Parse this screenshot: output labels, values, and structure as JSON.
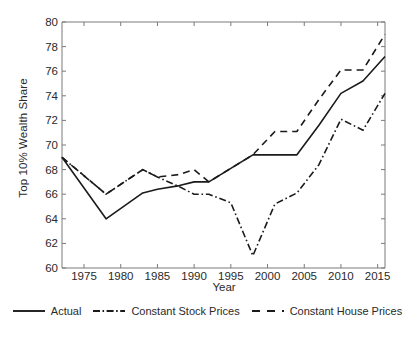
{
  "chart_data": {
    "type": "line",
    "title": "",
    "xlabel": "Year",
    "ylabel": "Top 10% Wealth Share",
    "xlim": [
      1972,
      2016
    ],
    "ylim": [
      60,
      80
    ],
    "xticks": [
      1975,
      1980,
      1985,
      1990,
      1995,
      2000,
      2005,
      2010,
      2015
    ],
    "yticks": [
      60,
      62,
      64,
      66,
      68,
      70,
      72,
      74,
      76,
      78,
      80
    ],
    "grid": false,
    "legend_position": "bottom",
    "series": [
      {
        "name": "Actual",
        "style": "solid",
        "color": "#1b1b1b",
        "x": [
          1972,
          1978,
          1983,
          1985,
          1988,
          1990,
          1992,
          1995,
          1998,
          2001,
          2004,
          2007,
          2010,
          2013,
          2016
        ],
        "values": [
          69.0,
          64.0,
          66.1,
          66.4,
          66.7,
          67.0,
          67.0,
          68.1,
          69.2,
          69.2,
          69.2,
          71.6,
          74.2,
          75.2,
          77.2
        ]
      },
      {
        "name": "Constant Stock Prices",
        "style": "dashdot",
        "color": "#1b1b1b",
        "x": [
          1972,
          1978,
          1983,
          1985,
          1988,
          1990,
          1992,
          1995,
          1998,
          2001,
          2004,
          2007,
          2010,
          2013,
          2016
        ],
        "values": [
          69.0,
          66.0,
          68.0,
          67.4,
          66.6,
          66.0,
          66.0,
          65.3,
          61.0,
          65.2,
          66.1,
          68.4,
          72.1,
          71.2,
          74.2
        ]
      },
      {
        "name": "Constant House Prices",
        "style": "dashed",
        "color": "#1b1b1b",
        "x": [
          1972,
          1978,
          1983,
          1985,
          1988,
          1990,
          1992,
          1995,
          1998,
          2001,
          2004,
          2007,
          2010,
          2013,
          2016
        ],
        "values": [
          69.0,
          66.0,
          68.0,
          67.4,
          67.6,
          68.0,
          67.0,
          68.1,
          69.2,
          71.1,
          71.1,
          73.7,
          76.1,
          76.1,
          79.0
        ]
      }
    ]
  },
  "axes": {
    "ylabel": "Top 10% Wealth Share",
    "xlabel": "Year",
    "yticks": [
      "80",
      "78",
      "76",
      "74",
      "72",
      "70",
      "68",
      "66",
      "64",
      "62",
      "60"
    ],
    "xticks": [
      "1975",
      "1980",
      "1985",
      "1990",
      "1995",
      "2000",
      "2005",
      "2010",
      "2015"
    ]
  },
  "legend": {
    "items": [
      {
        "label": "Actual",
        "style": "solid"
      },
      {
        "label": "Constant Stock Prices",
        "style": "dashdot"
      },
      {
        "label": "Constant House Prices",
        "style": "dashed"
      }
    ]
  }
}
